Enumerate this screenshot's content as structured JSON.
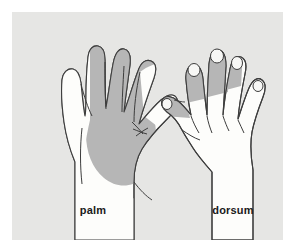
{
  "figure": {
    "type": "anatomical-diagram",
    "background_color": "#e6e6e4",
    "page_color": "#ffffff",
    "outline_color": "#3d3d3d",
    "skin_color": "#fdfdfb",
    "shade_color": "#b6b6b6",
    "nail_color": "#f7f7f5"
  },
  "labels": {
    "palm": "palm",
    "dorsum": "dorsum"
  },
  "views": [
    {
      "name": "palm",
      "label": "palm",
      "side": "left",
      "shaded_regions": [
        "thenar-palm-lateral",
        "index-finger-full",
        "middle-finger-full",
        "ring-finger-radial-half",
        "central-palm"
      ],
      "unshaded_regions": [
        "thumb",
        "little-finger",
        "hypothenar-palm-medial",
        "wrist"
      ],
      "nails_visible": false
    },
    {
      "name": "dorsum",
      "label": "dorsum",
      "side": "right",
      "shaded_regions": [
        "thumb-distal-tip",
        "index-finger-distal",
        "middle-finger-distal",
        "ring-finger-distal-radial-half"
      ],
      "unshaded_regions": [
        "little-finger",
        "dorsum-of-hand",
        "wrist",
        "proximal-phalanges"
      ],
      "nails_visible": true,
      "nail_count": 5
    }
  ]
}
